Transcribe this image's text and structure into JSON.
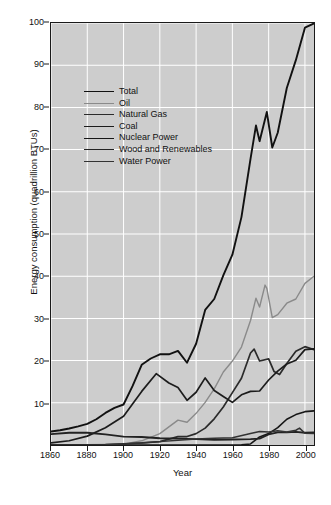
{
  "chart_data": {
    "type": "line",
    "title": "",
    "xlabel": "Year",
    "ylabel": "Energy consumption (quadrillion BTUs)",
    "xlim": [
      1860,
      2005
    ],
    "ylim": [
      0,
      100
    ],
    "xticks": [
      1860,
      1880,
      1900,
      1920,
      1940,
      1960,
      1980,
      2000
    ],
    "yticks": [
      10,
      20,
      30,
      40,
      50,
      60,
      70,
      80,
      90,
      100
    ],
    "grid": true,
    "legend_position": "upper-left-inside",
    "plot_background": "#cdcdcd",
    "gridline_color": "#ffffff",
    "series": [
      {
        "name": "Total",
        "color": "#111111",
        "width": 1.9,
        "x": [
          1860,
          1865,
          1870,
          1875,
          1880,
          1885,
          1890,
          1895,
          1900,
          1905,
          1910,
          1915,
          1920,
          1925,
          1930,
          1935,
          1940,
          1945,
          1950,
          1955,
          1960,
          1965,
          1970,
          1973,
          1975,
          1979,
          1982,
          1985,
          1990,
          1995,
          2000,
          2005
        ],
        "values": [
          3.2,
          3.5,
          3.9,
          4.4,
          5.0,
          6.1,
          7.6,
          8.8,
          9.6,
          14.0,
          19.0,
          20.5,
          21.5,
          21.5,
          22.3,
          19.5,
          24.0,
          32.0,
          34.6,
          40.2,
          45.1,
          54.0,
          67.8,
          75.7,
          72.0,
          78.9,
          70.5,
          74.0,
          84.6,
          91.2,
          98.9,
          99.9
        ]
      },
      {
        "name": "Oil",
        "color": "#8a8a8a",
        "width": 1.4,
        "x": [
          1860,
          1880,
          1900,
          1910,
          1920,
          1930,
          1935,
          1940,
          1945,
          1950,
          1955,
          1960,
          1965,
          1970,
          1973,
          1975,
          1978,
          1979,
          1982,
          1985,
          1990,
          1995,
          2000,
          2005
        ],
        "values": [
          0.0,
          0.1,
          0.2,
          1.0,
          2.7,
          5.9,
          5.4,
          7.5,
          10.1,
          13.3,
          17.3,
          19.9,
          23.2,
          29.5,
          34.8,
          32.7,
          37.9,
          37.1,
          30.2,
          30.9,
          33.6,
          34.6,
          38.3,
          40.0
        ]
      },
      {
        "name": "Natural Gas",
        "color": "#2b2b2b",
        "width": 1.7,
        "x": [
          1860,
          1890,
          1900,
          1910,
          1920,
          1930,
          1935,
          1940,
          1945,
          1950,
          1955,
          1960,
          1965,
          1970,
          1972,
          1975,
          1980,
          1983,
          1986,
          1990,
          1995,
          2000,
          2005
        ],
        "values": [
          0.0,
          0.1,
          0.3,
          0.5,
          0.8,
          2.0,
          2.0,
          2.7,
          4.0,
          6.2,
          9.0,
          12.4,
          15.8,
          21.8,
          22.7,
          19.9,
          20.4,
          17.4,
          16.7,
          19.3,
          22.2,
          23.3,
          22.6
        ]
      },
      {
        "name": "Coal",
        "color": "#1c1c1c",
        "width": 1.7,
        "x": [
          1860,
          1870,
          1880,
          1890,
          1900,
          1910,
          1918,
          1925,
          1930,
          1935,
          1940,
          1945,
          1950,
          1955,
          1960,
          1965,
          1970,
          1975,
          1980,
          1985,
          1990,
          1995,
          2000,
          2005
        ],
        "values": [
          0.5,
          1.0,
          2.1,
          4.1,
          6.8,
          12.7,
          16.9,
          14.7,
          13.6,
          10.6,
          12.5,
          15.9,
          12.9,
          11.5,
          10.1,
          11.9,
          12.7,
          12.8,
          15.4,
          17.5,
          19.2,
          20.1,
          22.6,
          22.8
        ]
      },
      {
        "name": "Nuclear Power",
        "color": "#161616",
        "width": 1.6,
        "x": [
          1860,
          1955,
          1960,
          1965,
          1970,
          1975,
          1980,
          1985,
          1990,
          1995,
          2000,
          2005
        ],
        "values": [
          0.0,
          0.0,
          0.0,
          0.04,
          0.24,
          1.9,
          2.7,
          4.1,
          6.1,
          7.2,
          7.9,
          8.1
        ]
      },
      {
        "name": "Wood and Renewables",
        "color": "#222222",
        "width": 1.8,
        "x": [
          1860,
          1870,
          1880,
          1890,
          1900,
          1910,
          1920,
          1930,
          1940,
          1950,
          1960,
          1970,
          1975,
          1980,
          1985,
          1990,
          1995,
          2000,
          2005
        ],
        "values": [
          2.6,
          2.9,
          2.9,
          2.5,
          2.0,
          1.9,
          1.6,
          1.5,
          1.4,
          1.2,
          1.3,
          1.4,
          1.5,
          2.5,
          3.0,
          3.0,
          3.1,
          2.9,
          3.0
        ]
      },
      {
        "name": "Water Power",
        "color": "#333333",
        "width": 1.5,
        "x": [
          1860,
          1890,
          1900,
          1910,
          1920,
          1930,
          1940,
          1950,
          1960,
          1970,
          1975,
          1980,
          1985,
          1990,
          1995,
          1997,
          2000,
          2005
        ],
        "values": [
          0.0,
          0.05,
          0.25,
          0.5,
          0.8,
          1.1,
          1.4,
          1.6,
          1.7,
          2.7,
          3.2,
          3.1,
          3.4,
          3.1,
          3.5,
          4.0,
          2.8,
          2.7
        ]
      }
    ]
  },
  "axes": {
    "y_title": "Energy consumption (quadrillion BTUs)",
    "x_title": "Year",
    "y_tick_labels": [
      "10",
      "20",
      "30",
      "40",
      "50",
      "60",
      "70",
      "80",
      "90",
      "100"
    ],
    "x_tick_labels": [
      "1860",
      "1880",
      "1900",
      "1920",
      "1940",
      "1960",
      "1980",
      "2000"
    ]
  },
  "legend": {
    "items": [
      {
        "label": "Total"
      },
      {
        "label": "Oil"
      },
      {
        "label": "Natural Gas"
      },
      {
        "label": "Coal"
      },
      {
        "label": "Nuclear Power"
      },
      {
        "label": "Wood and Renewables"
      },
      {
        "label": "Water Power"
      }
    ]
  }
}
